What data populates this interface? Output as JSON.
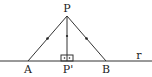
{
  "diagram": {
    "points": {
      "P": {
        "label": "P",
        "x": 67,
        "y": 16
      },
      "A": {
        "label": "A",
        "x": 28,
        "y": 61
      },
      "P_prime": {
        "label": "P'",
        "x": 67,
        "y": 61
      },
      "B": {
        "label": "B",
        "x": 106,
        "y": 61
      }
    },
    "line": {
      "label": "r",
      "x1": 0,
      "x2": 152,
      "y": 61
    },
    "segments": [
      {
        "from": "P",
        "to": "A",
        "tick": true
      },
      {
        "from": "P",
        "to": "P_prime",
        "tick": true
      },
      {
        "from": "P",
        "to": "B",
        "tick": true
      }
    ],
    "right_angle_marker": {
      "at": "P_prime",
      "symbol": "⊡"
    },
    "colors": {
      "stroke": "#333333",
      "text": "#222222",
      "background": "#ffffff"
    }
  }
}
